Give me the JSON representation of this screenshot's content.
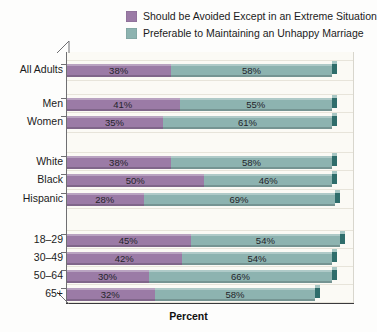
{
  "legend": {
    "items": [
      {
        "label": "Should be Avoided Except in an Extreme Situation",
        "color": "#9b7ba6",
        "name": "legend-avoided"
      },
      {
        "label": "Preferable to Maintaining an Unhappy Marriage",
        "color": "#8db3b0",
        "name": "legend-preferable"
      }
    ]
  },
  "axis": {
    "xlabel": "Percent"
  },
  "colors": {
    "purple": "#9b7ba6",
    "purple_dark": "#7a5c86",
    "purple_cap_top": "#b79dc0",
    "teal": "#8db3b0",
    "teal_dark": "#2f6d6b",
    "teal_cap_top": "#a8c7c4",
    "plot_bg": "#fbfaf5",
    "axis": "#6f6f72",
    "axis_bottom": "#3a3a3c",
    "grid": "#e7e4da",
    "page_bg": "#fdfdfc"
  },
  "chart_data": {
    "type": "bar",
    "orientation": "horizontal",
    "stacked": true,
    "title": "",
    "xlabel": "Percent",
    "ylabel": "",
    "xlim": [
      0,
      100
    ],
    "grid": true,
    "legend_position": "top-right",
    "categories": [
      "All Adults",
      "Men",
      "Women",
      "White",
      "Black",
      "Hispanic",
      "18–29",
      "30–49",
      "50–64",
      "65+"
    ],
    "groups": [
      {
        "name": "all",
        "categories": [
          "All Adults"
        ]
      },
      {
        "name": "gender",
        "categories": [
          "Men",
          "Women"
        ]
      },
      {
        "name": "race",
        "categories": [
          "White",
          "Black",
          "Hispanic"
        ]
      },
      {
        "name": "age",
        "categories": [
          "18–29",
          "30–49",
          "50–64",
          "65+"
        ]
      }
    ],
    "series": [
      {
        "name": "Should be Avoided Except in an Extreme Situation",
        "color": "#9b7ba6",
        "values": [
          38,
          41,
          35,
          38,
          50,
          28,
          45,
          42,
          30,
          32
        ]
      },
      {
        "name": "Preferable to Maintaining an Unhappy Marriage",
        "color": "#8db3b0",
        "values": [
          58,
          55,
          61,
          58,
          46,
          69,
          54,
          54,
          66,
          58
        ]
      }
    ],
    "rows": [
      {
        "label": "All Adults",
        "avoided": 38,
        "preferable": 58,
        "avoided_text": "38%",
        "preferable_text": "58%"
      },
      {
        "label": "Men",
        "avoided": 41,
        "preferable": 55,
        "avoided_text": "41%",
        "preferable_text": "55%"
      },
      {
        "label": "Women",
        "avoided": 35,
        "preferable": 61,
        "avoided_text": "35%",
        "preferable_text": "61%"
      },
      {
        "label": "White",
        "avoided": 38,
        "preferable": 58,
        "avoided_text": "38%",
        "preferable_text": "58%"
      },
      {
        "label": "Black",
        "avoided": 50,
        "preferable": 46,
        "avoided_text": "50%",
        "preferable_text": "46%"
      },
      {
        "label": "Hispanic",
        "avoided": 28,
        "preferable": 69,
        "avoided_text": "28%",
        "preferable_text": "69%"
      },
      {
        "label": "18–29",
        "avoided": 45,
        "preferable": 54,
        "avoided_text": "45%",
        "preferable_text": "54%"
      },
      {
        "label": "30–49",
        "avoided": 42,
        "preferable": 54,
        "avoided_text": "42%",
        "preferable_text": "54%"
      },
      {
        "label": "50–64",
        "avoided": 30,
        "preferable": 66,
        "avoided_text": "30%",
        "preferable_text": "66%"
      },
      {
        "label": "65+",
        "avoided": 32,
        "preferable": 58,
        "avoided_text": "32%",
        "preferable_text": "58%"
      }
    ]
  }
}
